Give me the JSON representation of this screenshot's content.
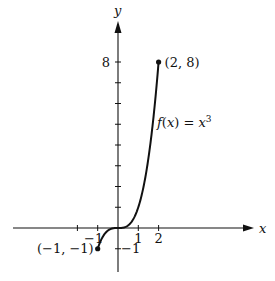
{
  "chart_data": {
    "type": "line",
    "title": "",
    "function_label": "f(x) = x³",
    "function_label_parts": {
      "f": "f",
      "open": "(",
      "x": "x",
      "close": ")",
      "eq": " = ",
      "base": "x",
      "exp": "3"
    },
    "xlabel": "x",
    "ylabel": "y",
    "domain": [
      -1,
      2
    ],
    "x": [
      -1,
      -0.75,
      -0.5,
      -0.25,
      0,
      0.25,
      0.5,
      0.75,
      1,
      1.25,
      1.5,
      1.75,
      2
    ],
    "y": [
      -1,
      -0.421875,
      -0.125,
      -0.015625,
      0,
      0.015625,
      0.125,
      0.421875,
      1,
      1.953125,
      3.375,
      5.359375,
      8
    ],
    "endpoints": [
      {
        "x": -1,
        "y": -1,
        "label": "(−1, −1)"
      },
      {
        "x": 2,
        "y": 8,
        "label": "(2, 8)"
      }
    ],
    "x_ticks": [
      -2,
      -1,
      1,
      2
    ],
    "x_tick_labels": [
      {
        "value": -1,
        "label": "−1"
      },
      {
        "value": 1,
        "label": "1"
      },
      {
        "value": 2,
        "label": "2"
      }
    ],
    "y_ticks": [
      -1,
      1,
      2,
      3,
      4,
      5,
      6,
      7,
      8
    ],
    "y_tick_labels": [
      {
        "value": 8,
        "label": "8"
      },
      {
        "value": -1,
        "label": "−1"
      }
    ],
    "xlim": [
      -2.6,
      3.3
    ],
    "ylim": [
      -2.1,
      9.9
    ],
    "grid": false,
    "legend": "none"
  },
  "colors": {
    "ink": "#111111",
    "background": "#ffffff"
  }
}
